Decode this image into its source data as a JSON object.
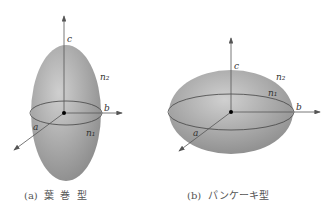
{
  "figures": [
    {
      "id": "a",
      "caption": "(a)  葉  巻  型",
      "labels": {
        "c": "c",
        "n2": "n₂",
        "b": "b",
        "a": "a",
        "n1": "n₁"
      }
    },
    {
      "id": "b",
      "caption": "(b)  パンケーキ型",
      "labels": {
        "c": "c",
        "n2": "n₂",
        "b": "b",
        "a": "a",
        "n1": "n₁"
      }
    }
  ],
  "colors": {
    "fill_light": "#c8c8c8",
    "fill_dark": "#8a8a8a",
    "line": "#444444"
  }
}
